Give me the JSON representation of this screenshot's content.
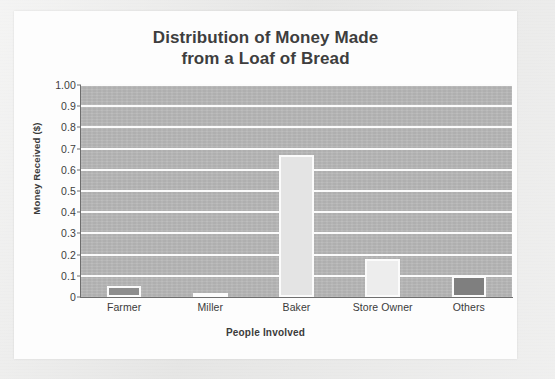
{
  "chart_data": {
    "type": "bar",
    "title": "Distribution of Money Made from a Loaf of Bread",
    "title_lines": [
      "Distribution of Money Made",
      "from a Loaf of Bread"
    ],
    "categories": [
      "Farmer",
      "Miller",
      "Baker",
      "Store Owner",
      "Others"
    ],
    "values": [
      0.05,
      0.01,
      0.67,
      0.18,
      0.1
    ],
    "xlabel": "People Involved",
    "ylabel": "Money Received ($)",
    "ylim": [
      0,
      1.0
    ],
    "ytick_labels": [
      "1.00",
      "0.9",
      "0.8",
      "0.7",
      "0.6",
      "0.5",
      "0.4",
      "0.3",
      "0.2",
      "0.1",
      "0"
    ],
    "ytick_values": [
      1.0,
      0.9,
      0.8,
      0.7,
      0.6,
      0.5,
      0.4,
      0.3,
      0.2,
      0.1,
      0
    ],
    "grid": true,
    "grid_color": "#fbfbfb",
    "legend": null,
    "legend_position": "none",
    "plot_background_color": "#b6b6b6",
    "figure_background_color": "#fdfdfd",
    "bar_outline_color": "#fbfbfb",
    "bar_colors": [
      "#8d8d8d",
      "#2f2f2f",
      "#e4e4e4",
      "#ededed",
      "#7f7f7f"
    ],
    "title_color": "#3e3e3e",
    "axis_text_color": "#3b3b3b"
  }
}
